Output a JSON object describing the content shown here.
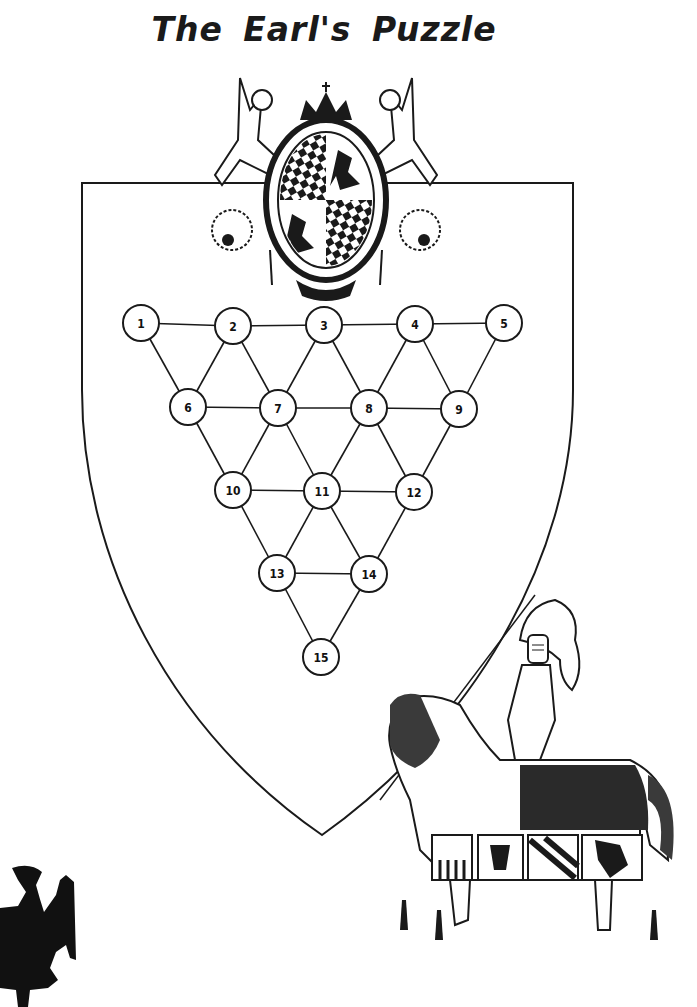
{
  "title": "The Earl's Puzzle",
  "colors": {
    "ink": "#1a1a1a",
    "paper": "#ffffff"
  },
  "puzzle": {
    "nodes": [
      {
        "id": 1,
        "label": "1",
        "x": 141,
        "y": 323
      },
      {
        "id": 2,
        "label": "2",
        "x": 233,
        "y": 326
      },
      {
        "id": 3,
        "label": "3",
        "x": 324,
        "y": 325
      },
      {
        "id": 4,
        "label": "4",
        "x": 415,
        "y": 324
      },
      {
        "id": 5,
        "label": "5",
        "x": 504,
        "y": 323
      },
      {
        "id": 6,
        "label": "6",
        "x": 188,
        "y": 407
      },
      {
        "id": 7,
        "label": "7",
        "x": 278,
        "y": 408
      },
      {
        "id": 8,
        "label": "8",
        "x": 369,
        "y": 408
      },
      {
        "id": 9,
        "label": "9",
        "x": 459,
        "y": 409
      },
      {
        "id": 10,
        "label": "10",
        "x": 233,
        "y": 490
      },
      {
        "id": 11,
        "label": "11",
        "x": 322,
        "y": 491
      },
      {
        "id": 12,
        "label": "12",
        "x": 414,
        "y": 492
      },
      {
        "id": 13,
        "label": "13",
        "x": 277,
        "y": 573
      },
      {
        "id": 14,
        "label": "14",
        "x": 369,
        "y": 574
      },
      {
        "id": 15,
        "label": "15",
        "x": 321,
        "y": 657
      }
    ],
    "edges": [
      [
        1,
        2
      ],
      [
        2,
        3
      ],
      [
        3,
        4
      ],
      [
        4,
        5
      ],
      [
        6,
        7
      ],
      [
        7,
        8
      ],
      [
        8,
        9
      ],
      [
        10,
        11
      ],
      [
        11,
        12
      ],
      [
        13,
        14
      ],
      [
        1,
        6
      ],
      [
        2,
        6
      ],
      [
        2,
        7
      ],
      [
        3,
        7
      ],
      [
        3,
        8
      ],
      [
        4,
        8
      ],
      [
        4,
        9
      ],
      [
        5,
        9
      ],
      [
        6,
        10
      ],
      [
        7,
        10
      ],
      [
        7,
        11
      ],
      [
        8,
        11
      ],
      [
        8,
        12
      ],
      [
        9,
        12
      ],
      [
        10,
        13
      ],
      [
        11,
        13
      ],
      [
        11,
        14
      ],
      [
        12,
        14
      ],
      [
        13,
        15
      ],
      [
        14,
        15
      ]
    ]
  },
  "illustrations": {
    "crest": "coat-of-arms with two winged figures, crown, lozenge and lion quarters",
    "knight": "armored knight on caparisoned horse",
    "eagle": "heraldic eagle silhouette"
  }
}
